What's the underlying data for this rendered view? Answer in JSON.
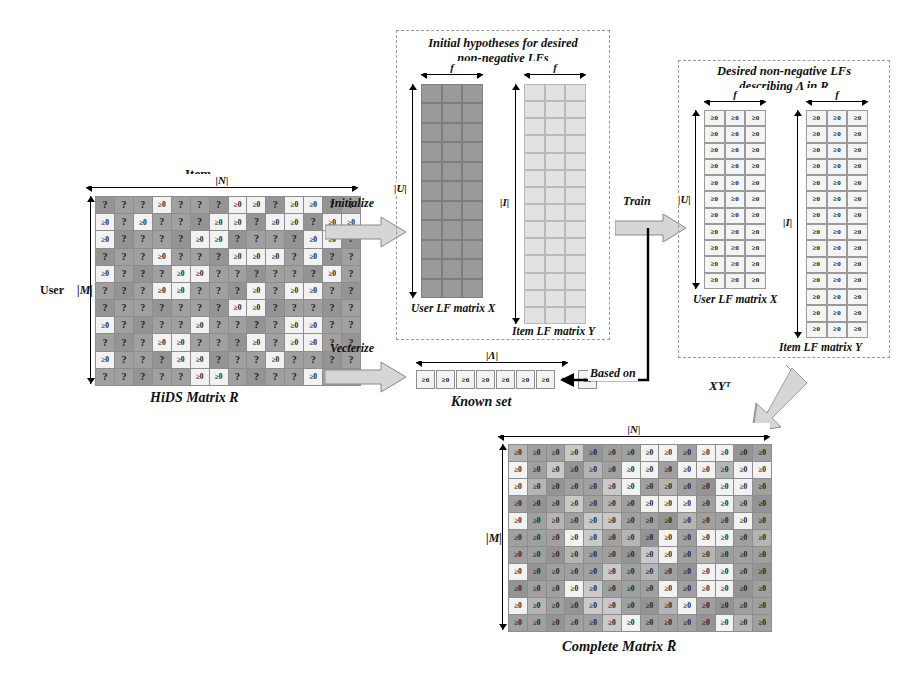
{
  "figure": {
    "symbols": {
      "ge0": "≥0",
      "unknown": "?",
      "ellipsis": "⋯"
    }
  },
  "hids": {
    "axis_top_label": "Item",
    "axis_top_dim": "|N|",
    "axis_left_label": "User",
    "axis_left_dim": "|M|",
    "caption": "HiDS Matrix R",
    "rows": 11,
    "cols": 14,
    "known_token": "≥0",
    "unknown_token": "?",
    "pattern": [
      [
        0,
        0,
        0,
        1,
        0,
        0,
        0,
        1,
        1,
        0,
        1,
        1,
        0,
        0
      ],
      [
        1,
        0,
        1,
        0,
        0,
        0,
        1,
        1,
        0,
        1,
        1,
        0,
        1,
        1
      ],
      [
        1,
        0,
        0,
        0,
        0,
        1,
        1,
        0,
        0,
        0,
        0,
        1,
        1,
        0
      ],
      [
        0,
        0,
        0,
        1,
        0,
        0,
        0,
        1,
        1,
        1,
        0,
        1,
        0,
        0
      ],
      [
        1,
        0,
        0,
        0,
        1,
        1,
        0,
        0,
        0,
        0,
        0,
        0,
        1,
        0
      ],
      [
        0,
        0,
        0,
        1,
        1,
        0,
        0,
        0,
        1,
        0,
        1,
        1,
        0,
        0
      ],
      [
        0,
        0,
        0,
        0,
        0,
        0,
        0,
        1,
        1,
        0,
        0,
        0,
        0,
        0
      ],
      [
        1,
        0,
        0,
        0,
        0,
        1,
        0,
        0,
        0,
        0,
        1,
        1,
        0,
        0
      ],
      [
        0,
        0,
        0,
        1,
        1,
        0,
        0,
        0,
        1,
        0,
        1,
        1,
        0,
        0
      ],
      [
        1,
        0,
        0,
        0,
        1,
        1,
        0,
        0,
        0,
        1,
        0,
        0,
        0,
        0
      ],
      [
        0,
        0,
        0,
        0,
        0,
        1,
        1,
        0,
        0,
        0,
        0,
        1,
        0,
        0
      ]
    ]
  },
  "initialize_arrow": {
    "label": "Initialize"
  },
  "vecterize_arrow": {
    "label": "Vecterize"
  },
  "train_arrow": {
    "label": "Train"
  },
  "based_on_arrow": {
    "label": "Based on"
  },
  "product_arrow": {
    "label": "XYᵀ"
  },
  "init_panel": {
    "title_line1": "Initial hypotheses for desired",
    "title_line2": "non-negative LFs",
    "user_matrix": {
      "caption": "User LF matrix X",
      "width_label": "f",
      "height_label": "|U|",
      "rows": 11,
      "cols": 3,
      "cell_token": ""
    },
    "item_matrix": {
      "caption": "Item LF matrix Y",
      "width_label": "f",
      "height_label": "|I|",
      "rows": 14,
      "cols": 3,
      "cell_token": ""
    }
  },
  "known_set": {
    "caption": "Known set",
    "dim_label": "|Λ|",
    "cells": [
      "≥0",
      "≥0",
      "≥0",
      "≥0",
      "≥0",
      "≥0",
      "≥0"
    ],
    "ellipsis": "⋯",
    "tail_cell": "≥0"
  },
  "desired_panel": {
    "title_line1": "Desired non-negative LFs",
    "title_line2": "describing Λ in R",
    "user_matrix": {
      "caption": "User LF matrix X",
      "width_label": "f",
      "height_label": "|U|",
      "rows": 11,
      "cols": 3,
      "cell_token": "≥0"
    },
    "item_matrix": {
      "caption": "Item LF matrix Y",
      "width_label": "f",
      "height_label": "|I|",
      "rows": 14,
      "cols": 3,
      "cell_token": "≥0"
    }
  },
  "complete": {
    "axis_top_dim": "|N|",
    "axis_left_dim": "|M|",
    "caption": "Complete  Matrix R̄",
    "rows": 11,
    "cols": 14,
    "cell_token": "≥0",
    "shade_pattern": [
      [
        0,
        0,
        0,
        2,
        0,
        0,
        0,
        1,
        1,
        0,
        1,
        1,
        0,
        0
      ],
      [
        1,
        0,
        2,
        0,
        0,
        0,
        1,
        1,
        0,
        1,
        1,
        0,
        1,
        1
      ],
      [
        1,
        0,
        0,
        0,
        0,
        2,
        1,
        0,
        0,
        0,
        0,
        1,
        1,
        0
      ],
      [
        0,
        0,
        0,
        2,
        0,
        0,
        0,
        1,
        1,
        1,
        0,
        1,
        0,
        0
      ],
      [
        1,
        0,
        0,
        0,
        2,
        2,
        0,
        0,
        0,
        0,
        0,
        0,
        1,
        0
      ],
      [
        0,
        0,
        0,
        1,
        2,
        0,
        0,
        0,
        1,
        0,
        1,
        1,
        0,
        0
      ],
      [
        0,
        0,
        0,
        0,
        0,
        0,
        0,
        2,
        1,
        0,
        0,
        0,
        0,
        0
      ],
      [
        1,
        0,
        0,
        0,
        0,
        2,
        0,
        0,
        0,
        0,
        1,
        1,
        0,
        0
      ],
      [
        0,
        0,
        0,
        1,
        2,
        0,
        0,
        0,
        1,
        0,
        1,
        1,
        0,
        0
      ],
      [
        1,
        0,
        0,
        0,
        2,
        2,
        0,
        0,
        0,
        1,
        0,
        0,
        0,
        0
      ],
      [
        0,
        0,
        0,
        0,
        0,
        2,
        1,
        0,
        0,
        0,
        0,
        1,
        0,
        0
      ]
    ]
  },
  "colors": {
    "dark_cell": "#a0a0a0",
    "light_cell": "#f2f2f2",
    "mid_cell": "#c9c9c9",
    "panel_border": "#9a9a9a",
    "arrow_fill": "#d6d6d6",
    "arrow_stroke": "#8a8a8a"
  }
}
